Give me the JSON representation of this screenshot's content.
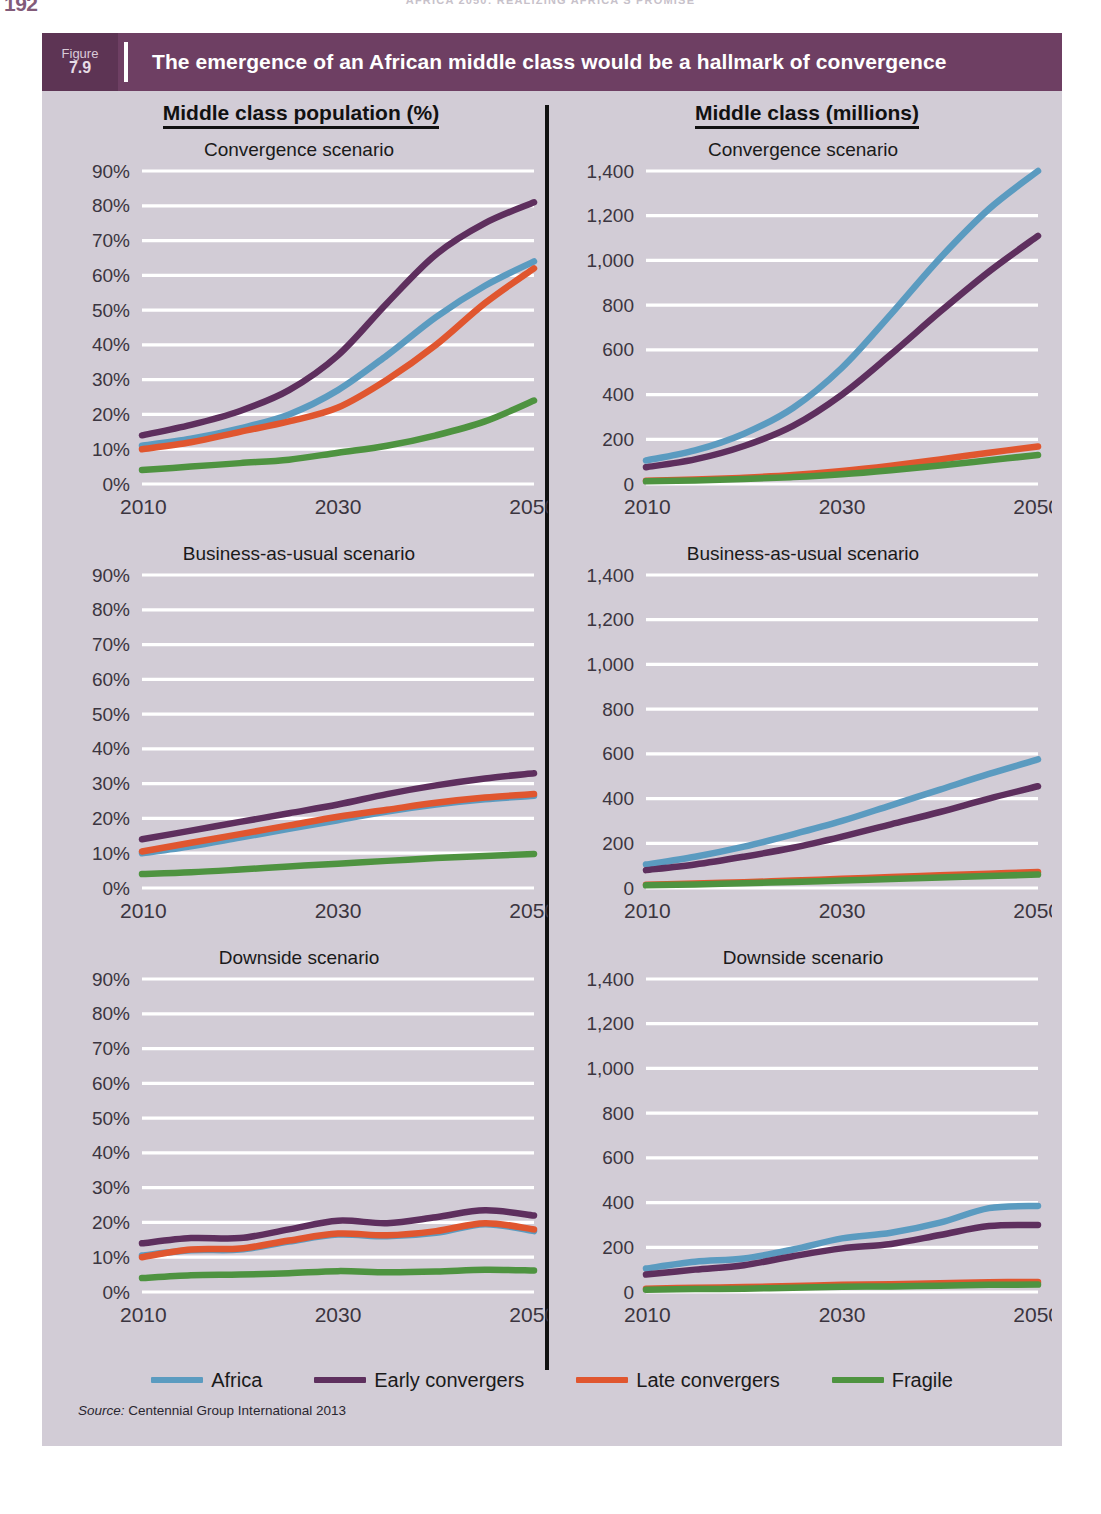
{
  "page": {
    "folio": "192",
    "running_head": "AFRICA 2050: REALIZING AFRICA'S PROMISE",
    "background": "#d2ccd6"
  },
  "figure": {
    "label_word": "Figure",
    "number": "7.9",
    "title": "The emergence of an African middle class would be a hallmark of convergence",
    "header_color": "#6e3f63",
    "header_badge_color": "#5d3454",
    "source_prefix": "Source:",
    "source_text": "Centennial Group International 2013"
  },
  "columns": [
    {
      "id": "pct",
      "heading": "Middle class population (%)"
    },
    {
      "id": "mil",
      "heading": "Middle class (millions)"
    }
  ],
  "legend": {
    "position": "bottom-center",
    "entries": [
      {
        "name": "Africa",
        "color": "#5b9bc0"
      },
      {
        "name": "Early convergers",
        "color": "#5e2f5e"
      },
      {
        "name": "Late convergers",
        "color": "#e0562f"
      },
      {
        "name": "Fragile",
        "color": "#4e9340"
      }
    ]
  },
  "chart_data": [
    {
      "id": "pct-convergence",
      "type": "line",
      "title": "Convergence scenario",
      "column": "Middle class population (%)",
      "xlabel": "",
      "ylabel": "Middle class population (%)",
      "x": [
        2010,
        2015,
        2020,
        2025,
        2030,
        2035,
        2040,
        2045,
        2050
      ],
      "xticks": [
        "2010",
        "2030",
        "2050"
      ],
      "xlim": [
        2010,
        2050
      ],
      "ylim": [
        0,
        90
      ],
      "yticks": [
        "0%",
        "10%",
        "20%",
        "30%",
        "40%",
        "50%",
        "60%",
        "70%",
        "80%",
        "90%"
      ],
      "ytick_values": [
        0,
        10,
        20,
        30,
        40,
        50,
        60,
        70,
        80,
        90
      ],
      "grid": true,
      "series": [
        {
          "name": "Africa",
          "color": "#5b9bc0",
          "values": [
            11,
            13,
            16,
            20,
            27,
            37,
            48,
            57,
            64
          ]
        },
        {
          "name": "Early convergers",
          "color": "#5e2f5e",
          "values": [
            14,
            17,
            21,
            27,
            37,
            52,
            66,
            75,
            81
          ]
        },
        {
          "name": "Late convergers",
          "color": "#e0562f",
          "values": [
            10,
            12,
            15,
            18,
            22,
            30,
            40,
            52,
            62
          ]
        },
        {
          "name": "Fragile",
          "color": "#4e9340",
          "values": [
            4,
            5,
            6,
            7,
            9,
            11,
            14,
            18,
            24
          ]
        }
      ]
    },
    {
      "id": "mil-convergence",
      "type": "line",
      "title": "Convergence scenario",
      "column": "Middle class (millions)",
      "xlabel": "",
      "ylabel": "Middle class (millions)",
      "x": [
        2010,
        2015,
        2020,
        2025,
        2030,
        2035,
        2040,
        2045,
        2050
      ],
      "xticks": [
        "2010",
        "2030",
        "2050"
      ],
      "xlim": [
        2010,
        2050
      ],
      "ylim": [
        0,
        1400
      ],
      "yticks": [
        "0",
        "200",
        "400",
        "600",
        "800",
        "1,000",
        "1,200",
        "1,400"
      ],
      "ytick_values": [
        0,
        200,
        400,
        600,
        800,
        1000,
        1200,
        1400
      ],
      "grid": true,
      "series": [
        {
          "name": "Africa",
          "color": "#5b9bc0",
          "values": [
            105,
            150,
            225,
            340,
            520,
            760,
            1010,
            1230,
            1400
          ]
        },
        {
          "name": "Early convergers",
          "color": "#5e2f5e",
          "values": [
            75,
            110,
            170,
            260,
            400,
            580,
            770,
            950,
            1110
          ]
        },
        {
          "name": "Late convergers",
          "color": "#e0562f",
          "values": [
            15,
            20,
            28,
            40,
            58,
            82,
            110,
            140,
            168
          ]
        },
        {
          "name": "Fragile",
          "color": "#4e9340",
          "values": [
            12,
            16,
            22,
            31,
            44,
            62,
            83,
            106,
            130
          ]
        }
      ]
    },
    {
      "id": "pct-bau",
      "type": "line",
      "title": "Business-as-usual scenario",
      "column": "Middle class population (%)",
      "xlabel": "",
      "ylabel": "Middle class population (%)",
      "x": [
        2010,
        2015,
        2020,
        2025,
        2030,
        2035,
        2040,
        2045,
        2050
      ],
      "xticks": [
        "2010",
        "2030",
        "2050"
      ],
      "xlim": [
        2010,
        2050
      ],
      "ylim": [
        0,
        90
      ],
      "yticks": [
        "0%",
        "10%",
        "20%",
        "30%",
        "40%",
        "50%",
        "60%",
        "70%",
        "80%",
        "90%"
      ],
      "ytick_values": [
        0,
        10,
        20,
        30,
        40,
        50,
        60,
        70,
        80,
        90
      ],
      "grid": true,
      "series": [
        {
          "name": "Africa",
          "color": "#5b9bc0",
          "values": [
            10,
            12,
            14.5,
            17,
            19.5,
            22,
            24,
            25.5,
            26.5
          ]
        },
        {
          "name": "Early convergers",
          "color": "#5e2f5e",
          "values": [
            14,
            16.5,
            19,
            21.5,
            24,
            27,
            29.5,
            31.5,
            33
          ]
        },
        {
          "name": "Late convergers",
          "color": "#e0562f",
          "values": [
            10.5,
            13,
            15.5,
            18,
            20.5,
            22.5,
            24.5,
            26,
            27
          ]
        },
        {
          "name": "Fragile",
          "color": "#4e9340",
          "values": [
            4,
            4.5,
            5.3,
            6.2,
            7,
            7.8,
            8.6,
            9.2,
            9.8
          ]
        }
      ]
    },
    {
      "id": "mil-bau",
      "type": "line",
      "title": "Business-as-usual scenario",
      "column": "Middle class (millions)",
      "xlabel": "",
      "ylabel": "Middle class (millions)",
      "x": [
        2010,
        2015,
        2020,
        2025,
        2030,
        2035,
        2040,
        2045,
        2050
      ],
      "xticks": [
        "2010",
        "2030",
        "2050"
      ],
      "xlim": [
        2010,
        2050
      ],
      "ylim": [
        0,
        1400
      ],
      "yticks": [
        "0",
        "200",
        "400",
        "600",
        "800",
        "1,000",
        "1,200",
        "1,400"
      ],
      "ytick_values": [
        0,
        200,
        400,
        600,
        800,
        1000,
        1200,
        1400
      ],
      "grid": true,
      "series": [
        {
          "name": "Africa",
          "color": "#5b9bc0",
          "values": [
            105,
            140,
            185,
            240,
            300,
            370,
            440,
            510,
            575
          ]
        },
        {
          "name": "Early convergers",
          "color": "#5e2f5e",
          "values": [
            80,
            105,
            140,
            180,
            230,
            285,
            340,
            400,
            455
          ]
        },
        {
          "name": "Late convergers",
          "color": "#e0562f",
          "values": [
            15,
            20,
            26,
            33,
            41,
            49,
            57,
            64,
            72
          ]
        },
        {
          "name": "Fragile",
          "color": "#4e9340",
          "values": [
            12,
            16,
            21,
            27,
            33,
            40,
            47,
            54,
            60
          ]
        }
      ]
    },
    {
      "id": "pct-downside",
      "type": "line",
      "title": "Downside scenario",
      "column": "Middle class population (%)",
      "xlabel": "",
      "ylabel": "Middle class population (%)",
      "x": [
        2010,
        2015,
        2020,
        2025,
        2030,
        2035,
        2040,
        2045,
        2050
      ],
      "xticks": [
        "2010",
        "2030",
        "2050"
      ],
      "xlim": [
        2010,
        2050
      ],
      "ylim": [
        0,
        90
      ],
      "yticks": [
        "0%",
        "10%",
        "20%",
        "30%",
        "40%",
        "50%",
        "60%",
        "70%",
        "80%",
        "90%"
      ],
      "ytick_values": [
        0,
        10,
        20,
        30,
        40,
        50,
        60,
        70,
        80,
        90
      ],
      "grid": true,
      "series": [
        {
          "name": "Africa",
          "color": "#5b9bc0",
          "values": [
            10.5,
            12,
            12.2,
            14.5,
            16.5,
            16,
            17,
            19.5,
            17.5
          ]
        },
        {
          "name": "Early convergers",
          "color": "#5e2f5e",
          "values": [
            14,
            15.5,
            15.5,
            18,
            20.5,
            19.8,
            21.5,
            23.5,
            22
          ]
        },
        {
          "name": "Late convergers",
          "color": "#e0562f",
          "values": [
            10,
            12.2,
            12.5,
            14.8,
            16.8,
            16.3,
            17.5,
            19.8,
            18
          ]
        },
        {
          "name": "Fragile",
          "color": "#4e9340",
          "values": [
            4,
            4.8,
            5,
            5.4,
            6,
            5.7,
            5.9,
            6.4,
            6.2
          ]
        }
      ]
    },
    {
      "id": "mil-downside",
      "type": "line",
      "title": "Downside scenario",
      "column": "Middle class (millions)",
      "xlabel": "",
      "ylabel": "Middle class (millions)",
      "x": [
        2010,
        2015,
        2020,
        2025,
        2030,
        2035,
        2040,
        2045,
        2050
      ],
      "xticks": [
        "2010",
        "2030",
        "2050"
      ],
      "xlim": [
        2010,
        2050
      ],
      "ylim": [
        0,
        1400
      ],
      "yticks": [
        "0",
        "200",
        "400",
        "600",
        "800",
        "1,000",
        "1,200",
        "1,400"
      ],
      "ytick_values": [
        0,
        200,
        400,
        600,
        800,
        1000,
        1200,
        1400
      ],
      "grid": true,
      "series": [
        {
          "name": "Africa",
          "color": "#5b9bc0",
          "values": [
            105,
            135,
            150,
            190,
            240,
            265,
            310,
            375,
            385
          ]
        },
        {
          "name": "Early convergers",
          "color": "#5e2f5e",
          "values": [
            78,
            100,
            120,
            160,
            195,
            215,
            255,
            295,
            300
          ]
        },
        {
          "name": "Late convergers",
          "color": "#e0562f",
          "values": [
            15,
            19,
            22,
            27,
            32,
            35,
            39,
            44,
            45
          ]
        },
        {
          "name": "Fragile",
          "color": "#4e9340",
          "values": [
            10,
            13,
            15,
            19,
            23,
            25,
            28,
            32,
            33
          ]
        }
      ]
    }
  ]
}
